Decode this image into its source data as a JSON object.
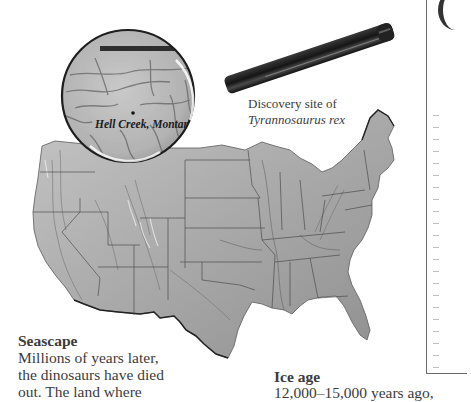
{
  "figure": {
    "magnifier": {
      "label": "Hell Creek, Montana"
    },
    "callout": {
      "line1": "Discovery site of",
      "line2": "Tyrannosaurus rex"
    },
    "colors": {
      "map_fill_light": "#b8b8b8",
      "map_fill_dark": "#7c7c7c",
      "border_line": "#3a3a3a",
      "handle": "#1e1e1e",
      "text": "#3c3c3c"
    }
  },
  "sections": {
    "seascape": {
      "title": "Seascape",
      "lines": [
        "Millions of years later,",
        "the dinosaurs have died",
        "out. The land where"
      ]
    },
    "ice_age": {
      "title": "Ice age",
      "lines": [
        "12,000–15,000 years ago,"
      ]
    }
  }
}
